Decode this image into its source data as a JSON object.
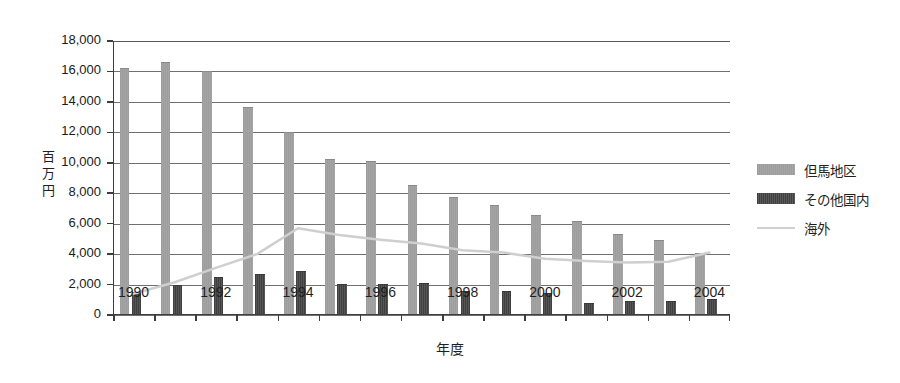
{
  "chart_data": {
    "type": "bar",
    "title": "",
    "subtitle": "",
    "xlabel": "年度",
    "ylabel": "百万円",
    "ylim": [
      0,
      18000
    ],
    "ytick_step": 2000,
    "yticks": [
      "0",
      "2,000",
      "4,000",
      "6,000",
      "8,000",
      "10,000",
      "12,000",
      "14,000",
      "16,000",
      "18,000"
    ],
    "grid": true,
    "legend_position": "right",
    "categories": [
      1990,
      1991,
      1992,
      1993,
      1994,
      1995,
      1996,
      1997,
      1998,
      1999,
      2000,
      2001,
      2002,
      2003,
      2004
    ],
    "xtick_labels": [
      "1990",
      "1992",
      "1994",
      "1996",
      "1998",
      "2000",
      "2002",
      "2004"
    ],
    "xtick_values": [
      1990,
      1992,
      1994,
      1996,
      1998,
      2000,
      2002,
      2004
    ],
    "series": [
      {
        "name": "但馬地区",
        "kind": "bar",
        "color": "#9d9d9d",
        "values": [
          16200,
          16600,
          16000,
          13650,
          12050,
          10250,
          10150,
          8550,
          7750,
          7250,
          6600,
          6200,
          5350,
          4900,
          4100
        ]
      },
      {
        "name": "その他国内",
        "kind": "bar",
        "color": "#474747",
        "values": [
          1500,
          2000,
          2500,
          2700,
          2900,
          2050,
          2050,
          2100,
          1550,
          1550,
          1450,
          800,
          950,
          900,
          1050
        ]
      },
      {
        "name": "海外",
        "kind": "line",
        "color": "#cfcfcf",
        "values": [
          1400,
          2150,
          3100,
          4000,
          5700,
          5250,
          4950,
          4700,
          4250,
          4100,
          3700,
          3550,
          3450,
          3500,
          4100
        ]
      }
    ]
  },
  "legend": {
    "items": [
      {
        "label": "但馬地区",
        "swatch": "bar-light-gray"
      },
      {
        "label": "その他国内",
        "swatch": "bar-dark-gray"
      },
      {
        "label": "海外",
        "swatch": "line-light-gray"
      }
    ]
  },
  "axes": {
    "y_title": "百万円",
    "x_title": "年度"
  }
}
